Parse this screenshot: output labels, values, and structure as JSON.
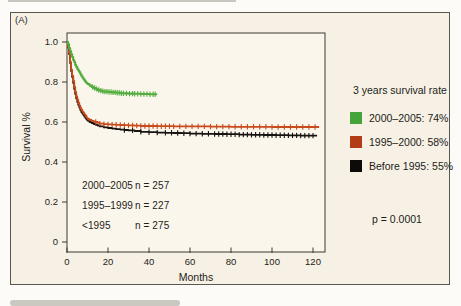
{
  "panel_label": "(A)",
  "annotations": [
    {
      "group": "2000–2005",
      "n": "n = 257"
    },
    {
      "group": "1995–1999",
      "n": "n = 227"
    },
    {
      "group": "<1995",
      "n": "n = 275"
    }
  ],
  "legend": {
    "title": "3 years survival rate",
    "items": [
      {
        "label": "2000–2005: 74%",
        "color": "#45a339"
      },
      {
        "label": "1995–2000: 58%",
        "color": "#b23c16"
      },
      {
        "label": "Before 1995: 55%",
        "color": "#0c0b09"
      }
    ],
    "p_value": "p = 0.0001"
  },
  "colors": {
    "panel_bg": "#f7f1e5",
    "plot_bg": "#fbf6ec",
    "frame": "#3c3a35",
    "text": "#1d1c19",
    "green_curve": "#52ad3e",
    "red_curve": "#c84b1e",
    "black_curve": "#161310"
  },
  "chart_data": {
    "type": "line",
    "subtype": "kaplan-meier-step",
    "title": "",
    "xlabel": "Months",
    "ylabel": "Survival %",
    "xlim": [
      0,
      126
    ],
    "ylim": [
      0,
      1.05
    ],
    "x_ticks": [
      0,
      20,
      40,
      60,
      80,
      100,
      120
    ],
    "x_tick_labels": [
      "0",
      "20",
      "40",
      "60",
      "80",
      "100",
      "120"
    ],
    "y_ticks": [
      1.0,
      0.8,
      0.6,
      0.4,
      0.2,
      0
    ],
    "y_tick_labels": [
      "1.0",
      "0.8",
      "0.6",
      "0.4",
      "0.2",
      "0"
    ],
    "grid": false,
    "legend_position": "right-outside",
    "p_value": "p = 0.0001",
    "series": [
      {
        "id": "before-1995",
        "name": "Before 1995",
        "n": 275,
        "three_year_survival_rate": "55%",
        "color": "#161310",
        "points": [
          [
            0,
            1.0
          ],
          [
            0.5,
            0.972
          ],
          [
            1,
            0.94
          ],
          [
            1.5,
            0.895
          ],
          [
            2,
            0.855
          ],
          [
            2.5,
            0.825
          ],
          [
            3,
            0.795
          ],
          [
            3.5,
            0.765
          ],
          [
            4,
            0.74
          ],
          [
            4.5,
            0.718
          ],
          [
            5,
            0.7
          ],
          [
            5.5,
            0.685
          ],
          [
            6,
            0.672
          ],
          [
            6.5,
            0.66
          ],
          [
            7,
            0.65
          ],
          [
            7.5,
            0.642
          ],
          [
            8,
            0.635
          ],
          [
            8.5,
            0.627
          ],
          [
            9,
            0.62
          ],
          [
            9.5,
            0.613
          ],
          [
            10,
            0.607
          ],
          [
            11,
            0.6
          ],
          [
            12,
            0.595
          ],
          [
            13,
            0.59
          ],
          [
            14,
            0.586
          ],
          [
            15,
            0.582
          ],
          [
            16,
            0.578
          ],
          [
            18,
            0.573
          ],
          [
            20,
            0.57
          ],
          [
            22,
            0.567
          ],
          [
            24,
            0.564
          ],
          [
            26,
            0.562
          ],
          [
            28,
            0.56
          ],
          [
            30,
            0.558
          ],
          [
            33,
            0.555
          ],
          [
            36,
            0.551
          ],
          [
            40,
            0.549
          ],
          [
            44,
            0.547
          ],
          [
            48,
            0.546
          ],
          [
            52,
            0.545
          ],
          [
            56,
            0.544
          ],
          [
            60,
            0.542
          ],
          [
            66,
            0.541
          ],
          [
            72,
            0.54
          ],
          [
            78,
            0.539
          ],
          [
            84,
            0.537
          ],
          [
            90,
            0.536
          ],
          [
            96,
            0.535
          ],
          [
            102,
            0.534
          ],
          [
            108,
            0.533
          ],
          [
            114,
            0.532
          ],
          [
            120,
            0.532
          ],
          [
            122,
            0.532
          ]
        ],
        "censor_x": [
          28,
          32,
          36,
          40,
          44,
          48,
          51,
          54,
          57,
          60,
          63,
          66,
          69,
          72,
          74,
          76,
          78,
          80,
          82,
          84,
          86,
          88,
          90,
          92,
          94,
          96,
          98,
          100,
          102,
          104,
          106,
          108,
          110,
          112,
          114,
          116,
          118,
          120
        ]
      },
      {
        "id": "1995-2000",
        "name": "1995–2000",
        "n": 227,
        "three_year_survival_rate": "58%",
        "color": "#c84b1e",
        "points": [
          [
            0,
            1.0
          ],
          [
            0.5,
            0.975
          ],
          [
            1,
            0.945
          ],
          [
            1.5,
            0.9
          ],
          [
            2,
            0.862
          ],
          [
            2.5,
            0.832
          ],
          [
            3,
            0.805
          ],
          [
            3.5,
            0.775
          ],
          [
            4,
            0.75
          ],
          [
            4.5,
            0.728
          ],
          [
            5,
            0.71
          ],
          [
            5.5,
            0.695
          ],
          [
            6,
            0.682
          ],
          [
            6.5,
            0.67
          ],
          [
            7,
            0.66
          ],
          [
            7.5,
            0.652
          ],
          [
            8,
            0.645
          ],
          [
            8.5,
            0.637
          ],
          [
            9,
            0.63
          ],
          [
            9.5,
            0.622
          ],
          [
            10,
            0.616
          ],
          [
            11,
            0.61
          ],
          [
            12,
            0.605
          ],
          [
            13,
            0.602
          ],
          [
            14,
            0.6
          ],
          [
            15,
            0.596
          ],
          [
            16,
            0.592
          ],
          [
            18,
            0.589
          ],
          [
            20,
            0.588
          ],
          [
            22,
            0.587
          ],
          [
            24,
            0.586
          ],
          [
            26,
            0.585
          ],
          [
            28,
            0.584
          ],
          [
            30,
            0.583
          ],
          [
            33,
            0.582
          ],
          [
            36,
            0.58
          ],
          [
            44,
            0.579
          ],
          [
            52,
            0.578
          ],
          [
            60,
            0.578
          ],
          [
            70,
            0.577
          ],
          [
            80,
            0.576
          ],
          [
            90,
            0.576
          ],
          [
            100,
            0.575
          ],
          [
            110,
            0.575
          ],
          [
            120,
            0.575
          ],
          [
            123,
            0.575
          ]
        ],
        "censor_x": [
          14,
          16,
          18,
          20,
          22,
          24,
          26,
          28,
          30,
          32,
          34,
          36,
          38,
          40,
          42,
          44,
          46,
          48,
          50,
          52,
          55,
          58,
          61,
          64,
          67,
          70,
          73,
          76,
          79,
          82,
          85,
          88,
          91,
          94,
          97,
          100,
          103,
          106,
          109,
          112,
          115,
          118,
          121
        ]
      },
      {
        "id": "2000-2005",
        "name": "2000–2005",
        "n": 257,
        "three_year_survival_rate": "74%",
        "color": "#52ad3e",
        "points": [
          [
            0,
            1.0
          ],
          [
            0.5,
            0.99
          ],
          [
            1,
            0.97
          ],
          [
            1.5,
            0.955
          ],
          [
            2,
            0.94
          ],
          [
            2.5,
            0.925
          ],
          [
            3,
            0.91
          ],
          [
            3.5,
            0.9
          ],
          [
            4,
            0.885
          ],
          [
            4.5,
            0.875
          ],
          [
            5,
            0.865
          ],
          [
            5.5,
            0.857
          ],
          [
            6,
            0.85
          ],
          [
            6.5,
            0.84
          ],
          [
            7,
            0.83
          ],
          [
            7.5,
            0.822
          ],
          [
            8,
            0.815
          ],
          [
            8.5,
            0.807
          ],
          [
            9,
            0.8
          ],
          [
            9.5,
            0.795
          ],
          [
            10,
            0.79
          ],
          [
            11,
            0.782
          ],
          [
            12,
            0.775
          ],
          [
            13,
            0.77
          ],
          [
            14,
            0.765
          ],
          [
            15,
            0.76
          ],
          [
            16,
            0.757
          ],
          [
            17,
            0.754
          ],
          [
            18,
            0.752
          ],
          [
            20,
            0.75
          ],
          [
            22,
            0.748
          ],
          [
            24,
            0.746
          ],
          [
            26,
            0.744
          ],
          [
            28,
            0.743
          ],
          [
            30,
            0.742
          ],
          [
            33,
            0.741
          ],
          [
            36,
            0.74
          ],
          [
            40,
            0.739
          ],
          [
            44,
            0.739
          ]
        ],
        "censor_x": [
          12.5,
          13.5,
          14.5,
          15.5,
          16.5,
          17.5,
          18.5,
          19.5,
          20.5,
          21.5,
          22.5,
          23.5,
          24.5,
          25.5,
          26.5,
          27.5,
          29,
          30.5,
          32,
          33,
          34.5,
          36,
          37.5,
          39,
          40.5,
          42,
          43
        ]
      }
    ]
  }
}
